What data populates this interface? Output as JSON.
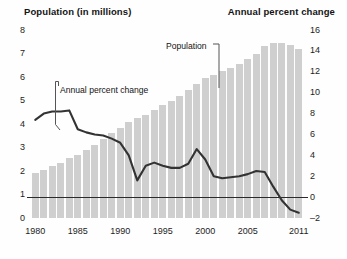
{
  "titles": {
    "left": "Population (in millions)",
    "right": "Annual percent change"
  },
  "callouts": {
    "population": "Population",
    "annual_percent_change": "Annual percent change"
  },
  "axes": {
    "left_ticks": [
      "8",
      "7",
      "6",
      "5",
      "4",
      "3",
      "2",
      "1",
      "0"
    ],
    "right_ticks": [
      "16",
      "14",
      "12",
      "10",
      "8",
      "6",
      "4",
      "2",
      "0",
      "–2"
    ],
    "x_ticks": [
      "1980",
      "1985",
      "1990",
      "1995",
      "2000",
      "2005",
      "2011"
    ]
  },
  "colors": {
    "bar": "#cfcfcf",
    "line": "#333333",
    "axis": "#2a2a2a",
    "text": "#141414",
    "background": "#fefefe"
  },
  "chart_data": {
    "type": "bar",
    "xlabel": "",
    "ylabel": "Population (in millions)",
    "y2label": "Annual percent change",
    "ylim": [
      0,
      8
    ],
    "y2lim": [
      -2,
      16
    ],
    "grid": false,
    "legend": "annotations",
    "categories": [
      1980,
      1981,
      1982,
      1983,
      1984,
      1985,
      1986,
      1987,
      1988,
      1989,
      1990,
      1991,
      1992,
      1993,
      1994,
      1995,
      1996,
      1997,
      1998,
      1999,
      2000,
      2001,
      2002,
      2003,
      2004,
      2005,
      2006,
      2007,
      2008,
      2009,
      2010,
      2011
    ],
    "series": [
      {
        "name": "Population",
        "type": "bar",
        "axis": "left",
        "unit": "millions",
        "values": [
          1.9,
          2.05,
          2.2,
          2.35,
          2.55,
          2.7,
          2.9,
          3.1,
          3.35,
          3.6,
          3.85,
          4.1,
          4.25,
          4.4,
          4.6,
          4.8,
          5.0,
          5.2,
          5.45,
          5.7,
          5.95,
          6.1,
          6.25,
          6.4,
          6.55,
          6.75,
          7.0,
          7.3,
          7.45,
          7.45,
          7.35,
          7.2
        ]
      },
      {
        "name": "Annual percent change",
        "type": "line",
        "axis": "right",
        "unit": "percent",
        "values": [
          7.4,
          8.0,
          8.2,
          8.2,
          8.3,
          6.5,
          6.2,
          6.0,
          5.9,
          5.6,
          5.2,
          4.0,
          1.6,
          3.0,
          3.3,
          3.0,
          2.8,
          2.8,
          3.2,
          4.6,
          3.6,
          2.0,
          1.8,
          1.9,
          2.0,
          2.2,
          2.5,
          2.4,
          1.0,
          -0.3,
          -1.2,
          -1.5
        ]
      }
    ]
  }
}
